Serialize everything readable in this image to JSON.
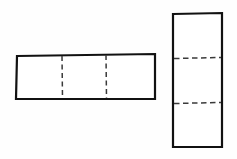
{
  "page": {
    "background_color": "#fefefe",
    "width": 237,
    "height": 159
  },
  "style": {
    "outline_color": "#111111",
    "outline_width": 2.2,
    "hidden_line_color": "#3a3a3a",
    "hidden_line_width": 1.4,
    "hidden_dash_pattern": "5,3.5"
  },
  "views": [
    {
      "id": "front-view",
      "label": "Front View",
      "orientation": "horizontal",
      "outline": {
        "x": 16,
        "y": 55,
        "width": 139,
        "height": 44
      },
      "corners": "17,56 155,54 155,99 16,99",
      "hidden_lines": [
        {
          "id": "hidden-line-vertical-1",
          "orientation": "vertical",
          "x": 62,
          "y1": 56,
          "y2": 98
        },
        {
          "id": "hidden-line-vertical-2",
          "orientation": "vertical",
          "x": 106,
          "y1": 55,
          "y2": 98
        }
      ],
      "segment_count": 3
    },
    {
      "id": "side-view",
      "label": "Side View",
      "orientation": "vertical",
      "outline": {
        "x": 172,
        "y": 13,
        "width": 50,
        "height": 134
      },
      "corners": "173,14 222,13 222,147 173,147",
      "hidden_lines": [
        {
          "id": "hidden-line-horizontal-1",
          "orientation": "horizontal",
          "y": 58,
          "x1": 174,
          "x2": 221
        },
        {
          "id": "hidden-line-horizontal-2",
          "orientation": "horizontal",
          "y": 103,
          "x1": 174,
          "x2": 221
        }
      ],
      "segment_count": 3
    }
  ]
}
